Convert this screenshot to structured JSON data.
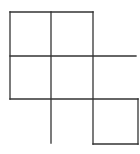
{
  "diagram": {
    "stroke_color": "#333333",
    "background": "#ffffff",
    "segments": [
      {
        "id": "top-edge",
        "x1": 10,
        "y1": 12,
        "x2": 93,
        "y2": 12
      },
      {
        "id": "row-line-1",
        "x1": 10,
        "y1": 56,
        "x2": 136,
        "y2": 56
      },
      {
        "id": "row-line-2",
        "x1": 10,
        "y1": 99,
        "x2": 138,
        "y2": 99
      },
      {
        "id": "bottom-square-edge",
        "x1": 93,
        "y1": 144,
        "x2": 138,
        "y2": 144
      },
      {
        "id": "left-vertical",
        "x1": 10,
        "y1": 12,
        "x2": 10,
        "y2": 99
      },
      {
        "id": "middle-vertical",
        "x1": 51,
        "y1": 12,
        "x2": 51,
        "y2": 143
      },
      {
        "id": "right-vertical",
        "x1": 93,
        "y1": 12,
        "x2": 93,
        "y2": 144
      },
      {
        "id": "far-right-vertical",
        "x1": 138,
        "y1": 99,
        "x2": 138,
        "y2": 144
      }
    ]
  }
}
